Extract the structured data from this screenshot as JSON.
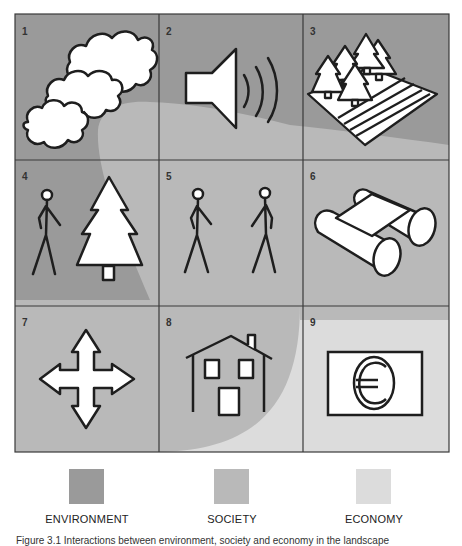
{
  "colors": {
    "environment": "#9a9a9a",
    "society": "#b9b9b9",
    "economy": "#dcdcdc",
    "stroke": "#1e1e1e",
    "icon_fill": "#ffffff",
    "grid_line": "#3a3a3a"
  },
  "cells": [
    {
      "number": "1",
      "icon": "clouds-icon",
      "label": "Clouds"
    },
    {
      "number": "2",
      "icon": "loudspeaker-icon",
      "label": "Sound"
    },
    {
      "number": "3",
      "icon": "forest-field-icon",
      "label": "Forest and field"
    },
    {
      "number": "4",
      "icon": "person-and-tree-icon",
      "label": "Person and tree"
    },
    {
      "number": "5",
      "icon": "two-people-icon",
      "label": "Two people"
    },
    {
      "number": "6",
      "icon": "binoculars-icon",
      "label": "Binoculars"
    },
    {
      "number": "7",
      "icon": "four-way-arrows-icon",
      "label": "Movement"
    },
    {
      "number": "8",
      "icon": "house-icon",
      "label": "House"
    },
    {
      "number": "9",
      "icon": "euro-banknote-icon",
      "label": "Euro"
    }
  ],
  "legend": [
    {
      "label": "ENVIRONMENT",
      "color": "#9a9a9a"
    },
    {
      "label": "SOCIETY",
      "color": "#b9b9b9"
    },
    {
      "label": "ECONOMY",
      "color": "#dcdcdc"
    }
  ],
  "caption": "Figure 3.1  Interactions between environment, society and economy in the landscape"
}
